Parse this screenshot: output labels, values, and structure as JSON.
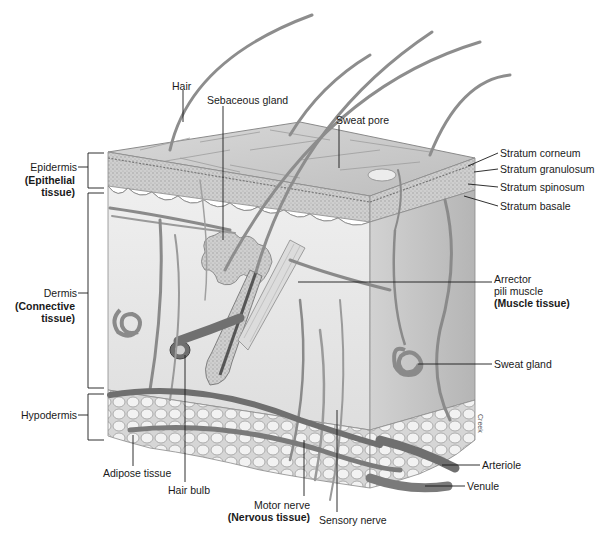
{
  "diagram": {
    "layers": [
      {
        "name": "Epidermis",
        "tissue": "(Epithelial tissue)"
      },
      {
        "name": "Dermis",
        "tissue": "(Connective tissue)"
      },
      {
        "name": "Hypodermis",
        "tissue": ""
      }
    ],
    "labels": {
      "hair": "Hair",
      "sebaceous_gland": "Sebaceous gland",
      "sweat_pore": "Sweat pore",
      "stratum_corneum": "Stratum corneum",
      "stratum_granulosum": "Stratum granulosum",
      "stratum_spinosum": "Stratum spinosum",
      "stratum_basale": "Stratum basale",
      "arrector_line1": "Arrector",
      "arrector_line2": "pili muscle",
      "muscle_tissue": "(Muscle tissue)",
      "sweat_gland": "Sweat gland",
      "arteriole": "Arteriole",
      "venule": "Venule",
      "sensory_nerve": "Sensory nerve",
      "motor_nerve": "Motor nerve",
      "nervous_tissue": "(Nervous tissue)",
      "hair_bulb": "Hair bulb",
      "adipose_tissue": "Adipose tissue",
      "epidermis": "Epidermis",
      "epithelial_line1": "(Epithelial",
      "epithelial_line2": "tissue)",
      "dermis": "Dermis",
      "connective_line1": "(Connective",
      "connective_line2": "tissue)",
      "hypodermis": "Hypodermis"
    },
    "credit": "Creek",
    "colors": {
      "background": "#ffffff",
      "tissue_light": "#e6e6e6",
      "tissue_mid": "#c8c8c8",
      "tissue_dark": "#8a8a8a",
      "vessel": "#7a7a7a",
      "leader_line": "#1a1a1a"
    }
  }
}
